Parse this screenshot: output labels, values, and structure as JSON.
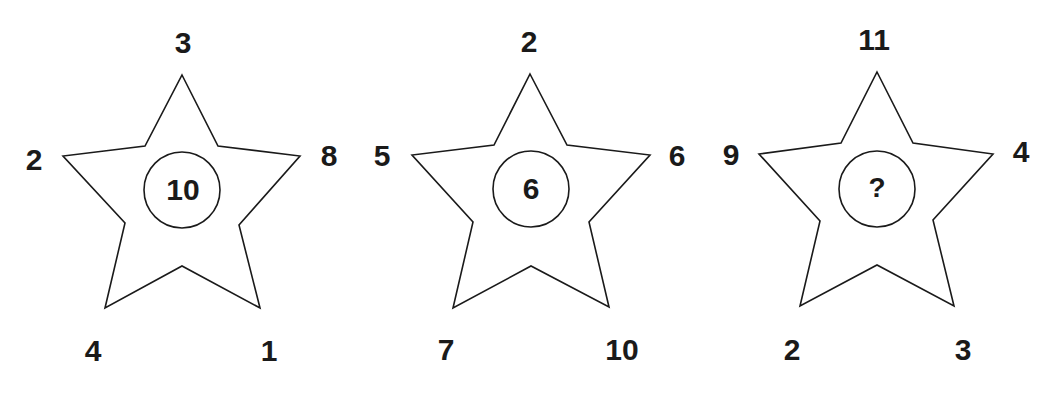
{
  "puzzle": {
    "stars": [
      {
        "points": {
          "top": "3",
          "left": "2",
          "right": "8",
          "bottom_left": "4",
          "bottom_right": "1"
        },
        "center": "10"
      },
      {
        "points": {
          "top": "2",
          "left": "5",
          "right": "6",
          "bottom_left": "7",
          "bottom_right": "10"
        },
        "center": "6"
      },
      {
        "points": {
          "top": "11",
          "left": "9",
          "right": "4",
          "bottom_left": "2",
          "bottom_right": "3"
        },
        "center": "?"
      }
    ],
    "colors": {
      "stroke": "#1a1a1a",
      "fill": "#ffffff",
      "text": "#1a1a1a"
    }
  }
}
